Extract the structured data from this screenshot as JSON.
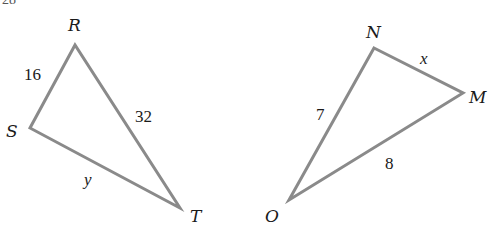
{
  "figure": {
    "partial_label": "28",
    "triangles": [
      {
        "name": "RST",
        "vertices": [
          "R",
          "S",
          "T"
        ],
        "sides": [
          {
            "between": [
              "R",
              "S"
            ],
            "label": "16"
          },
          {
            "between": [
              "R",
              "T"
            ],
            "label": "32"
          },
          {
            "between": [
              "S",
              "T"
            ],
            "label": "y"
          }
        ]
      },
      {
        "name": "NMO",
        "vertices": [
          "N",
          "M",
          "O"
        ],
        "sides": [
          {
            "between": [
              "N",
              "M"
            ],
            "label": "x"
          },
          {
            "between": [
              "N",
              "O"
            ],
            "label": "7"
          },
          {
            "between": [
              "M",
              "O"
            ],
            "label": "8"
          }
        ]
      }
    ]
  }
}
